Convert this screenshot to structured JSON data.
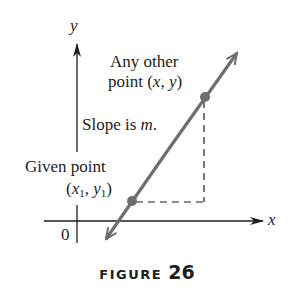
{
  "figure": {
    "caption_word": "FIGURE",
    "caption_number": "26"
  },
  "axes": {
    "x_label": "x",
    "y_label": "y",
    "origin_label": "0"
  },
  "labels": {
    "other_point_line1": "Any other",
    "other_point_line2_prefix": "point (",
    "other_point_x": "x",
    "other_point_sep": ", ",
    "other_point_y": "y",
    "other_point_suffix": ")",
    "slope_prefix": "Slope is ",
    "slope_var": "m",
    "slope_suffix": ".",
    "given_point_line1": "Given point",
    "given_open": "(",
    "given_x": "x",
    "given_x_sub": "1",
    "given_sep": ", ",
    "given_y": "y",
    "given_y_sub": "1",
    "given_close": ")"
  },
  "colors": {
    "line": "#6e6e6e",
    "axis": "#1e1e1e",
    "text": "#1e1e1e"
  }
}
